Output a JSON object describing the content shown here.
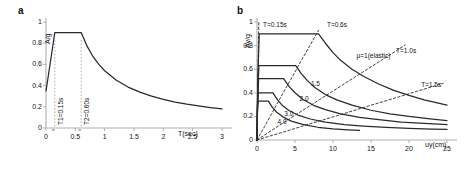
{
  "figure": {
    "panel_a_letter": "a",
    "panel_b_letter": "b"
  },
  "chart_data": [
    {
      "id": "panel-a",
      "type": "line",
      "title": "",
      "panel_letter": "a",
      "xlabel": "T(sec)",
      "ylabel": "A/g",
      "xlim": [
        0,
        3
      ],
      "ylim": [
        0,
        1
      ],
      "xticks": [
        "0",
        "0.5",
        "1",
        "1.5",
        "2",
        "2.5",
        "3"
      ],
      "xtick_values": [
        0,
        0.5,
        1,
        1.5,
        2,
        2.5,
        3
      ],
      "yticks": [
        "0",
        "0.2",
        "0.4",
        "0.6",
        "0.8",
        "1"
      ],
      "ytick_values": [
        0,
        0.2,
        0.4,
        0.6,
        0.8,
        1
      ],
      "grid": false,
      "legend": "none",
      "annotations": [
        {
          "text": "T1=0.15s",
          "x": 0.15,
          "y": 0.0,
          "rotation": -90
        },
        {
          "text": "T2=0.60s",
          "x": 0.6,
          "y": 0.0,
          "rotation": -90
        }
      ],
      "series": [
        {
          "name": "design-spectrum",
          "style": "solid",
          "x": [
            0.0,
            0.02,
            0.15,
            0.6,
            0.7,
            0.8,
            0.9,
            1.0,
            1.2,
            1.4,
            1.6,
            1.8,
            2.0,
            2.2,
            2.4,
            2.6,
            2.8,
            3.0
          ],
          "y": [
            0.35,
            0.42,
            0.9,
            0.9,
            0.772,
            0.675,
            0.6,
            0.54,
            0.45,
            0.386,
            0.338,
            0.3,
            0.27,
            0.245,
            0.225,
            0.208,
            0.193,
            0.18
          ]
        }
      ]
    },
    {
      "id": "panel-b",
      "type": "line",
      "title": "",
      "panel_letter": "b",
      "xlabel": "uy(cm)",
      "ylabel": "Ay/g",
      "xlim": [
        0,
        25
      ],
      "ylim": [
        0,
        1
      ],
      "xticks": [
        "0",
        "5",
        "10",
        "15",
        "20",
        "25"
      ],
      "xtick_values": [
        0,
        5,
        10,
        15,
        20,
        25
      ],
      "yticks": [
        "0",
        "0.2",
        "0.4",
        "0.6",
        "0.8",
        "1"
      ],
      "ytick_values": [
        0,
        0.2,
        0.4,
        0.6,
        0.8,
        1
      ],
      "grid": false,
      "legend": "inline-labels",
      "annotations": [
        {
          "text": "T=0.15s",
          "x": 0.8,
          "y": 0.965
        },
        {
          "text": "T=0.6s",
          "x": 9.2,
          "y": 0.965
        },
        {
          "text": "μ=1(elastic)",
          "x": 13.1,
          "y": 0.7
        },
        {
          "text": "T=1.0s",
          "x": 18.3,
          "y": 0.745
        },
        {
          "text": "T=1.5s",
          "x": 21.6,
          "y": 0.455
        },
        {
          "text": "1.5",
          "x": 7.1,
          "y": 0.47
        },
        {
          "text": "2.0",
          "x": 5.6,
          "y": 0.34
        },
        {
          "text": "3.0",
          "x": 3.6,
          "y": 0.215
        },
        {
          "text": "4.0",
          "x": 2.7,
          "y": 0.145
        }
      ],
      "series": [
        {
          "name": "mu=1 (elastic)",
          "label": "μ=1(elastic)",
          "style": "solid",
          "x": [
            0.0,
            0.1,
            0.3,
            0.55,
            8.1,
            9.0,
            10.0,
            11.0,
            12.5,
            14.0,
            16.0,
            18.0,
            20.0,
            22.0,
            25.0
          ],
          "y": [
            0.0,
            0.52,
            0.9,
            0.9,
            0.9,
            0.82,
            0.74,
            0.675,
            0.6,
            0.54,
            0.475,
            0.42,
            0.378,
            0.34,
            0.295
          ]
        },
        {
          "name": "mu=1.5",
          "label": "1.5",
          "style": "solid",
          "x": [
            0.0,
            0.1,
            0.25,
            0.4,
            5.1,
            5.8,
            6.6,
            7.6,
            9.0,
            10.5,
            12.5,
            15.0,
            17.5,
            20.0,
            22.5,
            25.0
          ],
          "y": [
            0.0,
            0.4,
            0.63,
            0.63,
            0.63,
            0.565,
            0.505,
            0.445,
            0.385,
            0.34,
            0.295,
            0.252,
            0.222,
            0.2,
            0.182,
            0.165
          ]
        },
        {
          "name": "mu=2.0",
          "label": "2.0",
          "style": "solid",
          "x": [
            0.0,
            0.08,
            0.22,
            0.35,
            3.5,
            4.2,
            5.0,
            6.0,
            7.5,
            9.0,
            11.0,
            13.5,
            16.0,
            19.0,
            22.0,
            25.0
          ],
          "y": [
            0.0,
            0.36,
            0.52,
            0.52,
            0.52,
            0.455,
            0.4,
            0.345,
            0.292,
            0.258,
            0.222,
            0.192,
            0.172,
            0.152,
            0.14,
            0.13
          ]
        },
        {
          "name": "mu=3.0",
          "label": "3.0",
          "style": "solid",
          "x": [
            0.0,
            0.07,
            0.18,
            0.3,
            2.1,
            2.7,
            3.3,
            4.2,
            5.5,
            7.0,
            9.0,
            11.5,
            14.0,
            17.0,
            20.0,
            23.0,
            25.0
          ],
          "y": [
            0.0,
            0.3,
            0.4,
            0.4,
            0.4,
            0.34,
            0.295,
            0.25,
            0.208,
            0.178,
            0.152,
            0.13,
            0.118,
            0.106,
            0.098,
            0.092,
            0.09
          ]
        },
        {
          "name": "mu=4.0",
          "label": "4.0",
          "style": "solid",
          "x": [
            0.0,
            0.06,
            0.15,
            0.25,
            1.5,
            2.0,
            2.6,
            3.4,
            4.5,
            6.0,
            8.0,
            10.0,
            12.0,
            13.5
          ],
          "y": [
            0.0,
            0.26,
            0.33,
            0.33,
            0.33,
            0.278,
            0.235,
            0.196,
            0.16,
            0.132,
            0.108,
            0.094,
            0.086,
            0.082
          ]
        },
        {
          "name": "T=0.15s (constant period)",
          "label": "T=0.15s",
          "style": "dashed",
          "x": [
            0.0,
            0.04,
            0.09,
            0.14,
            0.19,
            0.24
          ],
          "y": [
            0.0,
            0.18,
            0.4,
            0.62,
            0.82,
            1.0
          ]
        },
        {
          "name": "T=0.6s (constant period)",
          "label": "T=0.6s",
          "style": "dashed",
          "x": [
            0.0,
            1.0,
            2.2,
            3.4,
            4.6,
            5.8,
            7.0,
            8.1
          ],
          "y": [
            0.0,
            0.115,
            0.255,
            0.395,
            0.53,
            0.67,
            0.805,
            0.93
          ]
        },
        {
          "name": "T=1.0s (constant period)",
          "label": "T=1.0s",
          "style": "dashed",
          "x": [
            0.0,
            2.5,
            5.0,
            7.5,
            10.0,
            12.5,
            15.0,
            17.5,
            19.5
          ],
          "y": [
            0.0,
            0.105,
            0.21,
            0.312,
            0.415,
            0.518,
            0.62,
            0.722,
            0.805
          ]
        },
        {
          "name": "T=1.5s (constant period)",
          "label": "T=1.5s",
          "style": "dashed",
          "x": [
            0.0,
            3.5,
            7.0,
            10.5,
            14.0,
            17.5,
            21.0,
            24.5
          ],
          "y": [
            0.0,
            0.068,
            0.138,
            0.205,
            0.275,
            0.343,
            0.412,
            0.48
          ]
        }
      ]
    }
  ]
}
